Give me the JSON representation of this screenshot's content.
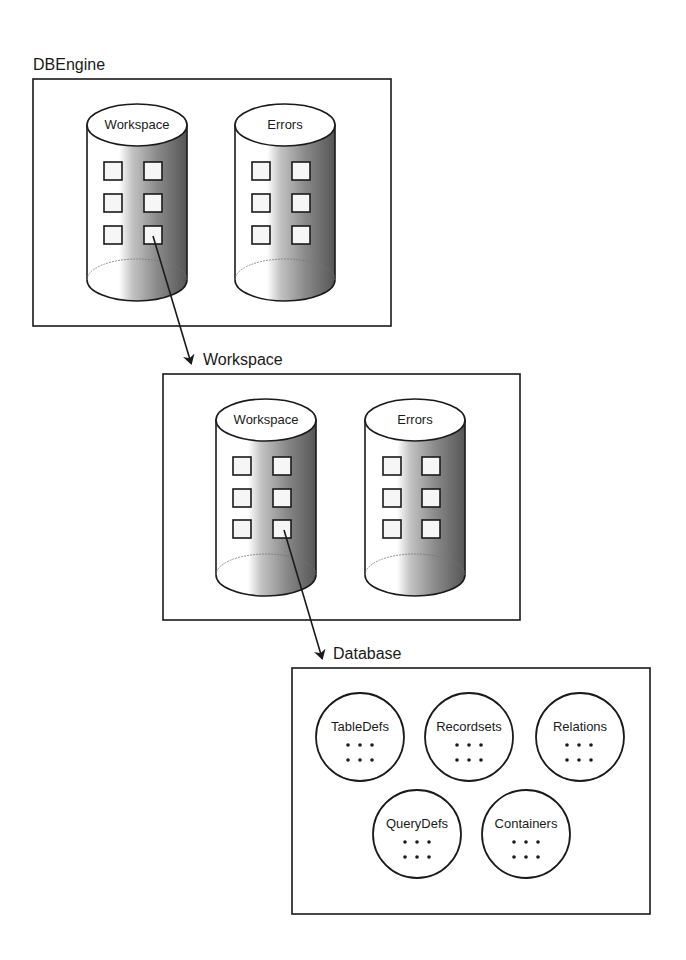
{
  "diagram": {
    "colors": {
      "stroke": "#1a1a1a",
      "background": "#ffffff",
      "gradient_light": "#ffffff",
      "gradient_mid": "#b8b8b8",
      "gradient_dark": "#5a5a5a"
    },
    "dbengine": {
      "title": "DBEngine",
      "collections": [
        {
          "label": "Workspace"
        },
        {
          "label": "Errors"
        }
      ]
    },
    "workspace": {
      "title": "Workspace",
      "collections": [
        {
          "label": "Workspace"
        },
        {
          "label": "Errors"
        }
      ]
    },
    "database": {
      "title": "Database",
      "collections": [
        {
          "label": "TableDefs"
        },
        {
          "label": "Recordsets"
        },
        {
          "label": "Relations"
        },
        {
          "label": "QueryDefs"
        },
        {
          "label": "Containers"
        }
      ]
    }
  }
}
